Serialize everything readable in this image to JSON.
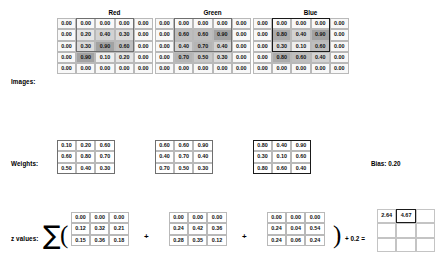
{
  "labels": {
    "images": "Images:",
    "weights": "Weights:",
    "z_values": "z values:"
  },
  "channels": [
    {
      "name": "Red"
    },
    {
      "name": "Green"
    },
    {
      "name": "Blue"
    }
  ],
  "bias": {
    "label": "Bias:",
    "value": "0.20",
    "text": "Bias: 0.20"
  },
  "math": {
    "sigma": "∑",
    "open_paren": "(",
    "close_paren": ")",
    "plus": "+",
    "tail": "+ 0.2 ="
  },
  "chart_data": {
    "type": "heatmap",
    "legend_position": "none",
    "grid": true,
    "images": {
      "label": "Images:",
      "shape": [
        5,
        5
      ],
      "channels": [
        {
          "name": "Red",
          "window": {
            "row_start": 0,
            "col_start": 1,
            "rows": 3,
            "cols": 3,
            "style": "gray"
          },
          "values": [
            [
              "0.00",
              "0.00",
              "0.00",
              "0.00",
              "0.00"
            ],
            [
              "0.00",
              "0.20",
              "0.40",
              "0.30",
              "0.00"
            ],
            [
              "0.00",
              "0.30",
              "0.90",
              "0.60",
              "0.00"
            ],
            [
              "0.00",
              "0.90",
              "0.10",
              "0.20",
              "0.00"
            ],
            [
              "0.00",
              "0.00",
              "0.00",
              "0.00",
              "0.00"
            ]
          ]
        },
        {
          "name": "Green",
          "window": {
            "row_start": 0,
            "col_start": 1,
            "rows": 3,
            "cols": 3,
            "style": "gray"
          },
          "values": [
            [
              "0.00",
              "0.00",
              "0.00",
              "0.00",
              "0.00"
            ],
            [
              "0.00",
              "0.60",
              "0.60",
              "0.90",
              "0.00"
            ],
            [
              "0.00",
              "0.40",
              "0.70",
              "0.40",
              "0.00"
            ],
            [
              "0.00",
              "0.70",
              "0.50",
              "0.30",
              "0.00"
            ],
            [
              "0.00",
              "0.00",
              "0.00",
              "0.00",
              "0.00"
            ]
          ]
        },
        {
          "name": "Blue",
          "window": {
            "row_start": 0,
            "col_start": 1,
            "rows": 3,
            "cols": 3,
            "style": "dark"
          },
          "values": [
            [
              "0.00",
              "0.00",
              "0.00",
              "0.00",
              "0.00"
            ],
            [
              "0.00",
              "0.80",
              "0.40",
              "0.90",
              "0.00"
            ],
            [
              "0.00",
              "0.30",
              "0.10",
              "0.60",
              "0.00"
            ],
            [
              "0.00",
              "0.80",
              "0.60",
              "0.40",
              "0.00"
            ],
            [
              "0.00",
              "0.00",
              "0.00",
              "0.00",
              "0.00"
            ]
          ]
        }
      ]
    },
    "weights": {
      "label": "Weights:",
      "shape": [
        3,
        3
      ],
      "channels": [
        {
          "name": "Red",
          "frame": "gray",
          "values": [
            [
              "0.10",
              "0.20",
              "0.60"
            ],
            [
              "0.60",
              "0.80",
              "0.70"
            ],
            [
              "0.50",
              "0.40",
              "0.30"
            ]
          ]
        },
        {
          "name": "Green",
          "frame": "gray",
          "values": [
            [
              "0.60",
              "0.60",
              "0.90"
            ],
            [
              "0.40",
              "0.70",
              "0.40"
            ],
            [
              "0.70",
              "0.50",
              "0.30"
            ]
          ]
        },
        {
          "name": "Blue",
          "frame": "dark",
          "values": [
            [
              "0.80",
              "0.40",
              "0.90"
            ],
            [
              "0.30",
              "0.10",
              "0.60"
            ],
            [
              "0.80",
              "0.60",
              "0.40"
            ]
          ]
        }
      ]
    },
    "z_values": {
      "label": "z values:",
      "shape": [
        3,
        3
      ],
      "terms": [
        {
          "name": "Red",
          "values": [
            [
              "0.00",
              "0.00",
              "0.00"
            ],
            [
              "0.12",
              "0.32",
              "0.21"
            ],
            [
              "0.15",
              "0.36",
              "0.18"
            ]
          ]
        },
        {
          "name": "Green",
          "values": [
            [
              "0.00",
              "0.00",
              "0.00"
            ],
            [
              "0.24",
              "0.42",
              "0.36"
            ],
            [
              "0.28",
              "0.35",
              "0.12"
            ]
          ]
        },
        {
          "name": "Blue",
          "values": [
            [
              "0.00",
              "0.00",
              "0.00"
            ],
            [
              "0.24",
              "0.04",
              "0.54"
            ],
            [
              "0.24",
              "0.06",
              "0.24"
            ]
          ]
        }
      ],
      "bias_term": "0.2",
      "expression": "+ 0.2 ="
    },
    "output": {
      "shape": [
        3,
        3
      ],
      "highlight": {
        "row": 0,
        "col": 1
      },
      "values": [
        [
          "2.64",
          "4.67",
          ""
        ],
        [
          "",
          "",
          ""
        ],
        [
          "",
          "",
          ""
        ]
      ]
    }
  }
}
